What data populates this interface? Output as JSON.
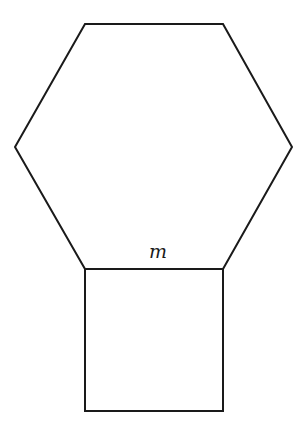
{
  "figure": {
    "hexagon": {
      "points": "85,24 223,24 292,147 223,269 85,269 15,147",
      "stroke": "#1a1a1a"
    },
    "square": {
      "x": 85,
      "y": 269,
      "width": 138,
      "height": 142,
      "stroke": "#1a1a1a"
    },
    "shared_side_label": "m"
  }
}
